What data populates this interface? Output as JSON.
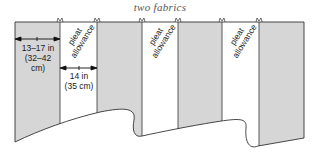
{
  "title": "two fabrics",
  "colors": {
    "main_fabric": "#d6d6d6",
    "pleat_fabric": "#ffffff",
    "outline": "#333333"
  },
  "panels": [
    {
      "type": "main",
      "x0": 15,
      "x1": 60
    },
    {
      "type": "pleat",
      "x0": 60,
      "x1": 97
    },
    {
      "type": "main",
      "x0": 97,
      "x1": 142
    },
    {
      "type": "pleat",
      "x0": 142,
      "x1": 178
    },
    {
      "type": "main",
      "x0": 178,
      "x1": 222
    },
    {
      "type": "pleat",
      "x0": 222,
      "x1": 259
    },
    {
      "type": "main",
      "x0": 259,
      "x1": 304
    }
  ],
  "labels": {
    "main_width_line1": "13–17 in",
    "main_width_line2": "(32–42",
    "main_width_line3": "cm)",
    "pleat_width_line1": "14 in",
    "pleat_width_line2": "(35 cm)",
    "pleat_1_line1": "pleat",
    "pleat_1_line2": "allowance",
    "pleat_2_line1": "pleat",
    "pleat_2_line2": "allowance",
    "pleat_3_line1": "pleat",
    "pleat_3_line2": "allowance"
  }
}
